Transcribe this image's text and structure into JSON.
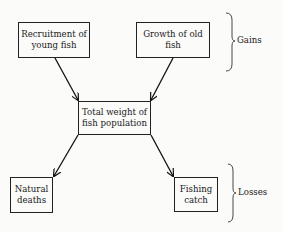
{
  "diagram": {
    "nodes": [
      {
        "id": "recruitment",
        "label": "Recruitment of young fish"
      },
      {
        "id": "growth",
        "label": "Growth of old fish"
      },
      {
        "id": "total",
        "label": "Total weight of fish population"
      },
      {
        "id": "natural",
        "label": "Natural deaths"
      },
      {
        "id": "fishing",
        "label": "Fishing catch"
      }
    ],
    "edges": [
      {
        "from": "recruitment",
        "to": "total"
      },
      {
        "from": "growth",
        "to": "total"
      },
      {
        "from": "total",
        "to": "natural"
      },
      {
        "from": "total",
        "to": "fishing"
      }
    ],
    "groups": [
      {
        "label": "Gains",
        "members": [
          "recruitment",
          "growth"
        ]
      },
      {
        "label": "Losses",
        "members": [
          "natural",
          "fishing"
        ]
      }
    ]
  }
}
